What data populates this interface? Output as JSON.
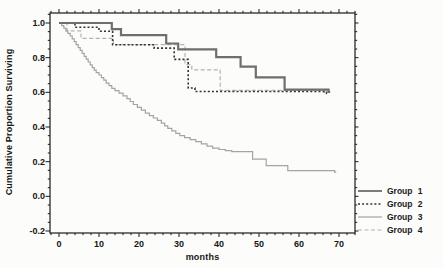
{
  "figure_name": "survival-plot",
  "colors": {
    "background": "#fcfcfa",
    "axis": "#1a1a1a",
    "text": "#161616"
  },
  "chart_data": {
    "type": "line",
    "subtype": "step-survival",
    "title": "",
    "xlabel": "months",
    "ylabel": "Cumulative Proportion Surviving",
    "xlim": [
      -2.25,
      74
    ],
    "ylim": [
      -0.21,
      1.06
    ],
    "grid": false,
    "legend_position": "outside-bottom-right",
    "x_ticks": [
      {
        "value": 0,
        "label": "0"
      },
      {
        "value": 10,
        "label": "10"
      },
      {
        "value": 20,
        "label": "20"
      },
      {
        "value": 30,
        "label": "30"
      },
      {
        "value": 40,
        "label": "40"
      },
      {
        "value": 50,
        "label": "50"
      },
      {
        "value": 60,
        "label": "60"
      },
      {
        "value": 70,
        "label": "70"
      }
    ],
    "x_minor_step": 2,
    "y_ticks": [
      {
        "value": 1.0,
        "label": "1.0"
      },
      {
        "value": 0.8,
        "label": "0.8"
      },
      {
        "value": 0.6,
        "label": "0.6"
      },
      {
        "value": 0.4,
        "label": "0.4"
      },
      {
        "value": 0.2,
        "label": "0.2"
      },
      {
        "value": 0.0,
        "label": "0.0"
      },
      {
        "value": -0.2,
        "label": "-0.2"
      }
    ],
    "y_minor_step": 0.05,
    "series": [
      {
        "name": "Group 1",
        "style": "solid",
        "color": "#6e6e6e",
        "width": 2.2,
        "end": 67.8,
        "points": [
          [
            0,
            1.0
          ],
          [
            13.2,
            0.965
          ],
          [
            15.5,
            0.93
          ],
          [
            26.8,
            0.882
          ],
          [
            29.8,
            0.848
          ],
          [
            39.3,
            0.803
          ],
          [
            45.4,
            0.748
          ],
          [
            49.2,
            0.687
          ],
          [
            56.4,
            0.615
          ],
          [
            67.4,
            0.602
          ]
        ]
      },
      {
        "name": "Group 2",
        "style": "dotted",
        "color": "#333333",
        "width": 1.6,
        "end": 67.3,
        "points": [
          [
            0,
            1.0
          ],
          [
            4,
            0.975
          ],
          [
            10,
            0.952
          ],
          [
            13.4,
            0.875
          ],
          [
            23.8,
            0.855
          ],
          [
            28.8,
            0.79
          ],
          [
            32.3,
            0.625
          ],
          [
            34,
            0.605
          ],
          [
            66.9,
            0.593
          ]
        ]
      },
      {
        "name": "Group 3",
        "style": "solid",
        "color": "#a4a4a4",
        "width": 1.2,
        "end": 69.3,
        "points": [
          [
            0,
            1.0
          ],
          [
            0.7,
            0.985
          ],
          [
            1.2,
            0.97
          ],
          [
            1.7,
            0.955
          ],
          [
            2.2,
            0.94
          ],
          [
            2.8,
            0.925
          ],
          [
            3.3,
            0.908
          ],
          [
            3.8,
            0.892
          ],
          [
            4.3,
            0.875
          ],
          [
            4.8,
            0.858
          ],
          [
            5.3,
            0.842
          ],
          [
            5.8,
            0.825
          ],
          [
            6.3,
            0.808
          ],
          [
            6.8,
            0.792
          ],
          [
            7.3,
            0.775
          ],
          [
            7.8,
            0.758
          ],
          [
            8.3,
            0.742
          ],
          [
            8.8,
            0.728
          ],
          [
            9.3,
            0.713
          ],
          [
            10,
            0.7
          ],
          [
            10.6,
            0.685
          ],
          [
            11.2,
            0.67
          ],
          [
            11.8,
            0.653
          ],
          [
            12.5,
            0.638
          ],
          [
            13.2,
            0.623
          ],
          [
            14,
            0.61
          ],
          [
            15,
            0.595
          ],
          [
            16,
            0.58
          ],
          [
            17,
            0.563
          ],
          [
            17.8,
            0.547
          ],
          [
            18.6,
            0.53
          ],
          [
            19.6,
            0.513
          ],
          [
            20.6,
            0.497
          ],
          [
            21.6,
            0.48
          ],
          [
            22.6,
            0.465
          ],
          [
            23.6,
            0.452
          ],
          [
            24.6,
            0.438
          ],
          [
            25.6,
            0.422
          ],
          [
            26.4,
            0.407
          ],
          [
            27.2,
            0.392
          ],
          [
            28.2,
            0.378
          ],
          [
            29.2,
            0.363
          ],
          [
            30.2,
            0.35
          ],
          [
            31.4,
            0.338
          ],
          [
            32.8,
            0.327
          ],
          [
            34.2,
            0.315
          ],
          [
            35.6,
            0.303
          ],
          [
            37,
            0.29
          ],
          [
            38.4,
            0.278
          ],
          [
            40,
            0.27
          ],
          [
            41.6,
            0.264
          ],
          [
            43.2,
            0.258
          ],
          [
            48.4,
            0.215
          ],
          [
            51.8,
            0.177
          ],
          [
            57.2,
            0.148
          ],
          [
            68.9,
            0.139
          ]
        ]
      },
      {
        "name": "Group 4",
        "style": "dashed",
        "color": "#b2b2b2",
        "width": 1.2,
        "end": 66.6,
        "points": [
          [
            0,
            1.0
          ],
          [
            2,
            0.955
          ],
          [
            5.5,
            0.912
          ],
          [
            13.6,
            0.875
          ],
          [
            31.5,
            0.76
          ],
          [
            33.2,
            0.73
          ],
          [
            40.3,
            0.612
          ],
          [
            66.2,
            0.6
          ]
        ]
      }
    ]
  }
}
